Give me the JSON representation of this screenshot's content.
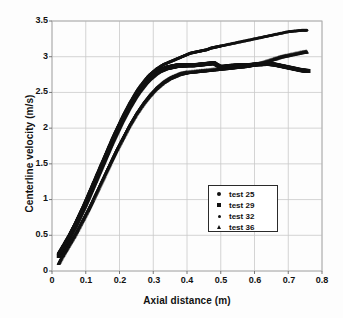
{
  "chart_data": {
    "type": "scatter",
    "title": "",
    "xlabel": "Axial distance (m)",
    "ylabel": "Centerline velocity (m/s)",
    "xlim": [
      0,
      0.8
    ],
    "ylim": [
      0,
      3.5
    ],
    "xticks": [
      "0",
      "0.1",
      "0.2",
      "0.3",
      "0.4",
      "0.5",
      "0.6",
      "0.7",
      "0.8"
    ],
    "yticks": [
      "0",
      "0.5",
      "1",
      "1.5",
      "2",
      "2.5",
      "3",
      "3.5"
    ],
    "grid": true,
    "legend_position": "inside-lower-right",
    "marker_color": "#111111",
    "series": [
      {
        "name": "test 25",
        "marker": "circle",
        "x": [
          0.02,
          0.03,
          0.04,
          0.05,
          0.06,
          0.07,
          0.08,
          0.09,
          0.1,
          0.11,
          0.12,
          0.13,
          0.14,
          0.15,
          0.16,
          0.17,
          0.18,
          0.19,
          0.2,
          0.21,
          0.22,
          0.23,
          0.24,
          0.25,
          0.26,
          0.27,
          0.28,
          0.29,
          0.3,
          0.31,
          0.32,
          0.33,
          0.34,
          0.35,
          0.36,
          0.37,
          0.38,
          0.39,
          0.4,
          0.42,
          0.44,
          0.46,
          0.48,
          0.5,
          0.52,
          0.54,
          0.56,
          0.58,
          0.6,
          0.62,
          0.64,
          0.66,
          0.68,
          0.7,
          0.72,
          0.74,
          0.755
        ],
        "y": [
          0.24,
          0.32,
          0.4,
          0.48,
          0.57,
          0.66,
          0.76,
          0.86,
          0.96,
          1.07,
          1.18,
          1.29,
          1.4,
          1.51,
          1.62,
          1.73,
          1.84,
          1.94,
          2.04,
          2.14,
          2.23,
          2.32,
          2.4,
          2.47,
          2.54,
          2.6,
          2.66,
          2.71,
          2.75,
          2.78,
          2.81,
          2.83,
          2.85,
          2.86,
          2.87,
          2.88,
          2.88,
          2.88,
          2.88,
          2.88,
          2.89,
          2.9,
          2.91,
          2.86,
          2.87,
          2.88,
          2.88,
          2.88,
          2.89,
          2.89,
          2.9,
          2.89,
          2.87,
          2.85,
          2.83,
          2.81,
          2.8
        ]
      },
      {
        "name": "test 29",
        "marker": "square",
        "x": [
          0.02,
          0.03,
          0.04,
          0.05,
          0.06,
          0.07,
          0.08,
          0.09,
          0.1,
          0.11,
          0.12,
          0.13,
          0.14,
          0.15,
          0.16,
          0.17,
          0.18,
          0.19,
          0.2,
          0.21,
          0.22,
          0.23,
          0.24,
          0.25,
          0.26,
          0.27,
          0.28,
          0.29,
          0.3,
          0.31,
          0.32,
          0.33,
          0.34,
          0.35,
          0.36,
          0.37,
          0.38,
          0.39,
          0.4,
          0.42,
          0.44,
          0.46,
          0.48,
          0.5,
          0.52,
          0.54,
          0.56,
          0.58,
          0.6,
          0.62,
          0.64,
          0.66,
          0.68,
          0.7,
          0.72,
          0.74,
          0.76
        ],
        "y": [
          0.21,
          0.29,
          0.37,
          0.45,
          0.54,
          0.63,
          0.73,
          0.83,
          0.93,
          1.04,
          1.15,
          1.26,
          1.37,
          1.48,
          1.59,
          1.7,
          1.81,
          1.91,
          2.01,
          2.11,
          2.2,
          2.29,
          2.37,
          2.45,
          2.52,
          2.58,
          2.64,
          2.69,
          2.73,
          2.77,
          2.8,
          2.82,
          2.84,
          2.85,
          2.86,
          2.87,
          2.87,
          2.88,
          2.88,
          2.88,
          2.89,
          2.9,
          2.91,
          2.85,
          2.86,
          2.87,
          2.88,
          2.88,
          2.89,
          2.9,
          2.9,
          2.89,
          2.87,
          2.85,
          2.83,
          2.81,
          2.8
        ]
      },
      {
        "name": "test 32",
        "marker": "dot",
        "x": [
          0.02,
          0.03,
          0.04,
          0.05,
          0.06,
          0.07,
          0.08,
          0.09,
          0.1,
          0.11,
          0.12,
          0.13,
          0.14,
          0.15,
          0.16,
          0.17,
          0.18,
          0.19,
          0.2,
          0.21,
          0.22,
          0.23,
          0.24,
          0.25,
          0.26,
          0.27,
          0.28,
          0.29,
          0.3,
          0.31,
          0.32,
          0.33,
          0.34,
          0.35,
          0.36,
          0.37,
          0.38,
          0.39,
          0.4,
          0.41,
          0.42,
          0.43,
          0.44,
          0.45,
          0.46,
          0.47,
          0.48,
          0.49,
          0.5,
          0.52,
          0.54,
          0.56,
          0.58,
          0.6,
          0.62,
          0.64,
          0.66,
          0.68,
          0.7,
          0.72,
          0.74,
          0.755
        ],
        "y": [
          0.24,
          0.32,
          0.4,
          0.49,
          0.58,
          0.68,
          0.78,
          0.88,
          0.99,
          1.1,
          1.21,
          1.32,
          1.43,
          1.54,
          1.65,
          1.76,
          1.87,
          1.97,
          2.07,
          2.17,
          2.26,
          2.35,
          2.43,
          2.51,
          2.58,
          2.64,
          2.7,
          2.75,
          2.79,
          2.83,
          2.86,
          2.89,
          2.91,
          2.93,
          2.95,
          2.97,
          2.99,
          3.01,
          3.03,
          3.05,
          3.06,
          3.07,
          3.08,
          3.09,
          3.1,
          3.12,
          3.13,
          3.14,
          3.15,
          3.17,
          3.19,
          3.21,
          3.23,
          3.25,
          3.27,
          3.29,
          3.31,
          3.33,
          3.35,
          3.36,
          3.37,
          3.37
        ]
      },
      {
        "name": "test 36",
        "marker": "triangle",
        "x": [
          0.02,
          0.03,
          0.04,
          0.05,
          0.06,
          0.07,
          0.08,
          0.09,
          0.1,
          0.11,
          0.12,
          0.13,
          0.14,
          0.15,
          0.16,
          0.17,
          0.18,
          0.19,
          0.2,
          0.21,
          0.22,
          0.23,
          0.24,
          0.25,
          0.26,
          0.27,
          0.28,
          0.29,
          0.3,
          0.31,
          0.32,
          0.33,
          0.34,
          0.35,
          0.36,
          0.37,
          0.38,
          0.39,
          0.4,
          0.42,
          0.44,
          0.46,
          0.48,
          0.5,
          0.52,
          0.54,
          0.56,
          0.58,
          0.6,
          0.62,
          0.64,
          0.66,
          0.68,
          0.7,
          0.72,
          0.74,
          0.755
        ],
        "y": [
          0.11,
          0.2,
          0.28,
          0.36,
          0.44,
          0.52,
          0.61,
          0.7,
          0.79,
          0.88,
          0.98,
          1.08,
          1.18,
          1.28,
          1.38,
          1.48,
          1.58,
          1.68,
          1.77,
          1.86,
          1.95,
          2.04,
          2.12,
          2.2,
          2.27,
          2.34,
          2.4,
          2.46,
          2.51,
          2.56,
          2.6,
          2.64,
          2.67,
          2.7,
          2.72,
          2.74,
          2.76,
          2.77,
          2.78,
          2.79,
          2.8,
          2.81,
          2.82,
          2.83,
          2.84,
          2.85,
          2.86,
          2.87,
          2.89,
          2.91,
          2.94,
          2.97,
          3.0,
          3.02,
          3.04,
          3.06,
          3.07
        ]
      }
    ]
  },
  "legend": {
    "items": [
      {
        "label": "test 25",
        "marker": "circle"
      },
      {
        "label": "test 29",
        "marker": "square"
      },
      {
        "label": "test 32",
        "marker": "dot"
      },
      {
        "label": "test 36",
        "marker": "triangle"
      }
    ]
  }
}
